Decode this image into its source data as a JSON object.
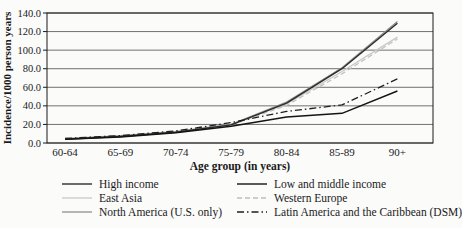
{
  "chart_data": {
    "type": "line",
    "title": "",
    "xlabel": "Age group (in years)",
    "ylabel": "Incidence/1000 person years",
    "categories": [
      "60-64",
      "65-69",
      "70-74",
      "75-79",
      "80-84",
      "85-89",
      "90+"
    ],
    "ylim": [
      0,
      140
    ],
    "ytick_step": 20,
    "ytick_labels": [
      "0.0",
      "20.0",
      "40.0",
      "60.0",
      "80.0",
      "100.0",
      "120.0",
      "140.0"
    ],
    "grid": "horizontal",
    "legend_position": "bottom-two-columns",
    "axis_color": "#1a1a1a",
    "gridline_color": "#4d4d4d",
    "series": [
      {
        "name": "High income",
        "color": "#2b2b2b",
        "dash": "solid",
        "width": 1.4,
        "values": [
          4,
          7,
          11.5,
          19.5,
          43,
          80,
          129
        ]
      },
      {
        "name": "Low and middle income",
        "color": "#141414",
        "dash": "solid",
        "width": 1.4,
        "values": [
          4,
          6.5,
          11,
          18,
          28,
          32,
          56
        ]
      },
      {
        "name": "East Asia",
        "color": "#c8c8c8",
        "dash": "solid",
        "width": 1.3,
        "values": [
          5,
          8,
          12.5,
          20,
          42,
          77,
          114
        ]
      },
      {
        "name": "Western Europe",
        "color": "#bfbfbf",
        "dash": "dashed",
        "width": 1.2,
        "values": [
          4.5,
          7.5,
          12,
          19.5,
          40.5,
          74.5,
          112
        ]
      },
      {
        "name": "North America (U.S. only)",
        "color": "#8f8f8f",
        "dash": "solid",
        "width": 1.3,
        "values": [
          4.5,
          7.5,
          12,
          20,
          44,
          81,
          131
        ]
      },
      {
        "name": "Latin America and the Caribbean (DSM)",
        "color": "#1f1f1f",
        "dash": "dashdot",
        "width": 1.3,
        "values": [
          5,
          8,
          13,
          22,
          34,
          41,
          69
        ]
      }
    ],
    "legend_columns": [
      [
        0,
        2,
        4
      ],
      [
        1,
        3,
        5
      ]
    ],
    "draw_order": [
      2,
      3,
      4,
      0,
      1,
      5
    ]
  }
}
